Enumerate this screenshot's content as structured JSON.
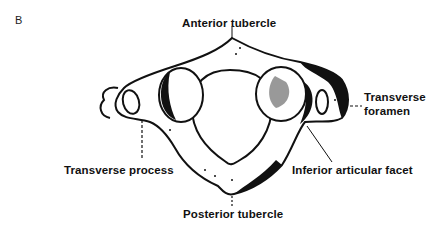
{
  "figure": {
    "panel_letter": "B",
    "labels": {
      "anterior_tubercle": "Anterior tubercle",
      "transverse_foramen_line1": "Transverse",
      "transverse_foramen_line2": "foramen",
      "transverse_process": "Transverse process",
      "inferior_articular_facet": "Inferior articular facet",
      "posterior_tubercle": "Posterior tubercle"
    }
  }
}
